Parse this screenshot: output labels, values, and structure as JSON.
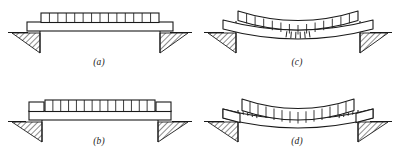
{
  "figure": {
    "background_color": "#ffffff",
    "ink_color": "#1a1a1a",
    "hatch_color": "#2b2b2b",
    "width_px": 396,
    "height_px": 161
  },
  "panels": [
    {
      "id": "a",
      "caption": "(a)",
      "description": "Straight simply supported beam with uniform load block resting on two hatched wedge supports",
      "state": "undeformed",
      "load_cells": 14,
      "load_block_style": "full-width-slab-with-cell-row",
      "crack_marks": 0,
      "crack_location": "none",
      "support_count": 2,
      "support_type": "hatched-wedge"
    },
    {
      "id": "b",
      "caption": "(b)",
      "description": "Straight beam with inset raised load block and separate plain end blocks over each support",
      "state": "undeformed",
      "load_cells": 14,
      "load_block_style": "inset-raised-with-end-blocks",
      "end_block_count": 2,
      "crack_marks": 0,
      "crack_location": "none",
      "support_count": 2,
      "support_type": "hatched-wedge"
    },
    {
      "id": "c",
      "caption": "(c)",
      "description": "Sagging simply supported beam, load block follows curve, flexural cracks open at bottom of midspan",
      "state": "deformed-sagging",
      "load_cells": 14,
      "load_block_style": "full-width-slab-with-cell-row",
      "crack_marks": 6,
      "crack_location": "bottom-midspan",
      "support_count": 2,
      "support_type": "hatched-wedge"
    },
    {
      "id": "d",
      "caption": "(d)",
      "description": "Sagging beam with fixed ends, cracks open at top of beam adjacent to each support",
      "state": "deformed-sagging",
      "load_cells": 14,
      "load_block_style": "inset-raised-with-end-blocks",
      "end_block_count": 2,
      "crack_marks": 8,
      "crack_location": "top-near-supports",
      "support_count": 2,
      "support_type": "hatched-wedge"
    }
  ]
}
